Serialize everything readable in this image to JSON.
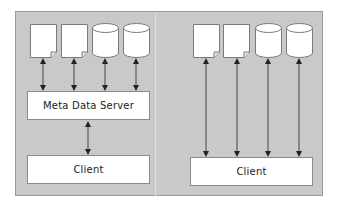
{
  "diagram": {
    "colors": {
      "panel": "#c9c9c9",
      "panel_border": "#9a9a9a",
      "box_fill": "#ffffff",
      "box_border": "#8a8a8a",
      "arrow": "#333333"
    },
    "left": {
      "storage": [
        {
          "type": "document-icon"
        },
        {
          "type": "document-icon"
        },
        {
          "type": "cylinder-icon"
        },
        {
          "type": "cylinder-icon"
        }
      ],
      "server_label": "Meta Data Server",
      "client_label": "Client"
    },
    "right": {
      "storage": [
        {
          "type": "document-icon"
        },
        {
          "type": "document-icon"
        },
        {
          "type": "cylinder-icon"
        },
        {
          "type": "cylinder-icon"
        }
      ],
      "client_label": "Client"
    }
  }
}
